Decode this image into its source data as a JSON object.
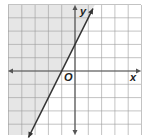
{
  "chart_data": {
    "type": "line",
    "title": "",
    "xlabel": "x",
    "ylabel": "y",
    "origin_label": "O",
    "xlim": [
      -5,
      5
    ],
    "ylim": [
      -5,
      5
    ],
    "grid": true,
    "grid_step": 1,
    "tick_labels": false,
    "legend": null,
    "series": [
      {
        "name": "boundary line y = 2x + 2",
        "equation": "y = 2x + 2",
        "slope": 2,
        "intercept": 2,
        "x_intercept": -1,
        "line_style": "solid",
        "arrows": "both",
        "x": [
          -3.5,
          1.35
        ],
        "y": [
          -5,
          4.7
        ]
      }
    ],
    "shaded_region": {
      "description": "half-plane left of / above the line",
      "inequality": "y >= 2x + 2",
      "color": "#e6e6e6"
    }
  },
  "labels": {
    "x_axis": "x",
    "y_axis": "y",
    "origin": "O"
  },
  "colors": {
    "grid": "#9a9a9a",
    "axis": "#555555",
    "line": "#333333",
    "shade": "#e6e6e6",
    "background": "#ffffff"
  }
}
